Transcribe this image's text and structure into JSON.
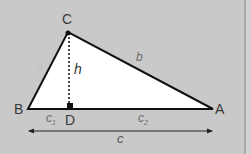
{
  "diagram": {
    "type": "triangle-altitude",
    "vertices": {
      "A": {
        "label": "A",
        "x": 213,
        "y": 109
      },
      "B": {
        "label": "B",
        "x": 28,
        "y": 109
      },
      "C": {
        "label": "C",
        "x": 68,
        "y": 32
      },
      "D": {
        "label": "D",
        "x": 70,
        "y": 109
      }
    },
    "sides": {
      "a": "a",
      "b": "b",
      "c": "c",
      "c1": "c",
      "c1_sub": "1",
      "c2": "c",
      "c2_sub": "2"
    },
    "altitude": {
      "label": "h"
    },
    "colors": {
      "background": "#c9c9c9",
      "triangle_fill": "#ffffff",
      "stroke": "#111111",
      "label": "#3a3a3a",
      "side_label": "#6e6e6e"
    }
  }
}
